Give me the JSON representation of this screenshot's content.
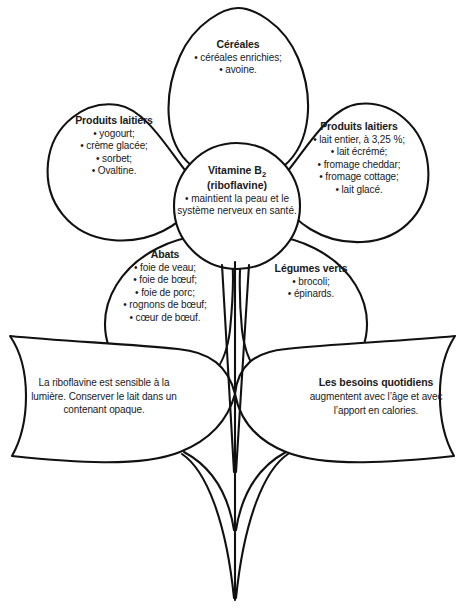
{
  "diagram": {
    "stroke_color": "#111111",
    "background_color": "#ffffff",
    "bullet": "•"
  },
  "center": {
    "title_line1": "Vitamine B",
    "title_subscript": "2",
    "title_line2": "(riboflavine)",
    "body": "• maintient la peau et le système nerveux en santé."
  },
  "petals": [
    {
      "id": "cereales",
      "title": "Céréales",
      "items": [
        "• céréales enrichies;",
        "• avoine."
      ]
    },
    {
      "id": "produits-laitiers-gauche",
      "title": "Produits laitiers",
      "items": [
        "• yogourt;",
        "• crème glacée;",
        "• sorbet;",
        "• Ovaltine."
      ]
    },
    {
      "id": "produits-laitiers-droite",
      "title": "Produits laitiers",
      "items": [
        "• lait entier, à 3,25 %;",
        "• lait écrémé;",
        "• fromage cheddar;",
        "• fromage cottage;",
        "• lait glacé."
      ]
    },
    {
      "id": "abats",
      "title": "Abats",
      "items": [
        "• foie de veau;",
        "• foie de bœuf;",
        "• foie de porc;",
        "• rognons de bœuf;",
        "• cœur de bœuf."
      ]
    },
    {
      "id": "legumes-verts",
      "title": "Légumes verts",
      "items": [
        "• brocoli;",
        "• épinards."
      ]
    }
  ],
  "leaves": [
    {
      "id": "conservation",
      "title": "",
      "body": "La riboflavine est sensible à la lumière. Conserver le lait dans un contenant opaque."
    },
    {
      "id": "besoins-quotidiens",
      "title": "Les besoins quotidiens",
      "body": "augmentent avec l’âge et avec l’apport en calories."
    }
  ]
}
